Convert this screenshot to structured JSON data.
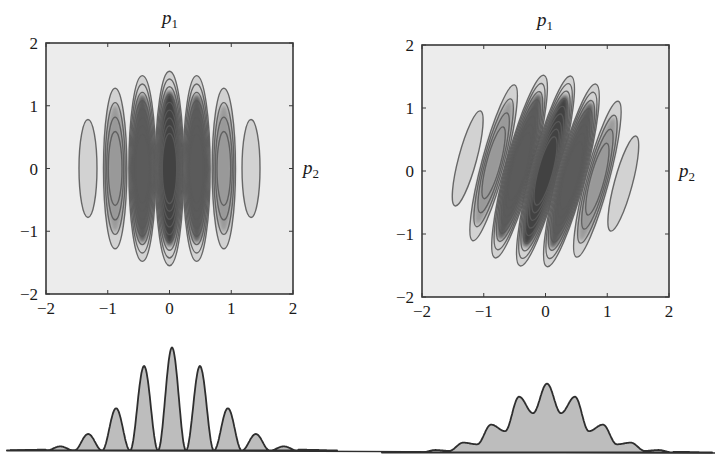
{
  "figure": {
    "colors": {
      "plot_bg": "#ececec",
      "frame": "#3a3a3a",
      "contour_line": "#5a5a5a",
      "contour_fill_light": "#d2d2d2",
      "density_dark": "#2a2a2a",
      "marginal_fill": "#bdbdbd",
      "marginal_line": "#2e2e2e",
      "text": "#1a1a1a"
    }
  },
  "chart_data": [
    {
      "type": "heatmap",
      "subtype": "contour",
      "panel": "top-left",
      "title": "",
      "top_label": "p",
      "top_label_sub": "1",
      "right_label": "p",
      "right_label_sub": "2",
      "xlim": [
        -2,
        2
      ],
      "ylim": [
        -2,
        2
      ],
      "x_ticks": [
        "-2",
        "-1",
        "0",
        "1",
        "2"
      ],
      "y_ticks": [
        "2",
        "1",
        "0",
        "-1",
        "-2"
      ],
      "grid": false,
      "tilt_deg": 0,
      "lobes": [
        {
          "x": -1.32,
          "y": 0.0,
          "half_height": 0.78,
          "levels": 1,
          "darkness": 0.05
        },
        {
          "x": -0.88,
          "y": 0.0,
          "half_height": 1.28,
          "levels": 4,
          "darkness": 0.35
        },
        {
          "x": -0.44,
          "y": 0.0,
          "half_height": 1.48,
          "levels": 8,
          "darkness": 0.75
        },
        {
          "x": 0.0,
          "y": 0.0,
          "half_height": 1.55,
          "levels": 9,
          "darkness": 0.9
        },
        {
          "x": 0.44,
          "y": 0.0,
          "half_height": 1.48,
          "levels": 8,
          "darkness": 0.75
        },
        {
          "x": 0.88,
          "y": 0.0,
          "half_height": 1.28,
          "levels": 4,
          "darkness": 0.35
        },
        {
          "x": 1.32,
          "y": 0.0,
          "half_height": 0.78,
          "levels": 1,
          "darkness": 0.05
        }
      ]
    },
    {
      "type": "heatmap",
      "subtype": "contour",
      "panel": "top-right",
      "title": "",
      "top_label": "p",
      "top_label_sub": "1",
      "right_label": "p",
      "right_label_sub": "2",
      "xlim": [
        -2,
        2
      ],
      "ylim": [
        -2,
        2
      ],
      "x_ticks": [
        "-2",
        "-1",
        "0",
        "1",
        "2"
      ],
      "y_ticks": [
        "2",
        "1",
        "0",
        "-1",
        "-2"
      ],
      "grid": false,
      "tilt_deg": 15,
      "lobes": [
        {
          "x": -1.26,
          "y": 0.2,
          "half_height": 0.78,
          "levels": 1,
          "darkness": 0.05
        },
        {
          "x": -0.84,
          "y": 0.13,
          "half_height": 1.28,
          "levels": 4,
          "darkness": 0.35
        },
        {
          "x": -0.42,
          "y": 0.07,
          "half_height": 1.5,
          "levels": 8,
          "darkness": 0.75
        },
        {
          "x": 0.0,
          "y": 0.0,
          "half_height": 1.56,
          "levels": 9,
          "darkness": 0.9
        },
        {
          "x": 0.42,
          "y": -0.07,
          "half_height": 1.5,
          "levels": 8,
          "darkness": 0.75
        },
        {
          "x": 0.84,
          "y": -0.13,
          "half_height": 1.28,
          "levels": 4,
          "darkness": 0.35
        },
        {
          "x": 1.26,
          "y": -0.2,
          "half_height": 0.78,
          "levels": 1,
          "darkness": 0.05
        }
      ]
    },
    {
      "type": "area",
      "panel": "bottom-left",
      "title": "",
      "description": "marginal fringe distribution, high visibility",
      "xlim": [
        -2,
        2
      ],
      "ylim": [
        0,
        1
      ],
      "axes_visible": false,
      "peak_x": [
        -1.76,
        -1.32,
        -0.88,
        -0.44,
        0.0,
        0.44,
        0.88,
        1.32,
        1.76
      ],
      "peak_heights": [
        0.04,
        0.16,
        0.41,
        0.82,
        1.0,
        0.82,
        0.41,
        0.16,
        0.04
      ],
      "trough_heights": [
        0.0,
        0.0,
        0.0,
        0.0,
        0.0,
        0.0,
        0.0,
        0.0
      ]
    },
    {
      "type": "area",
      "panel": "bottom-right",
      "title": "",
      "description": "marginal fringe distribution, reduced visibility",
      "xlim": [
        -2,
        2
      ],
      "ylim": [
        0,
        1
      ],
      "axes_visible": false,
      "peak_x": [
        -1.76,
        -1.32,
        -0.88,
        -0.44,
        0.0,
        0.44,
        0.88,
        1.32,
        1.76
      ],
      "peak_heights": [
        0.03,
        0.12,
        0.34,
        0.68,
        0.84,
        0.68,
        0.34,
        0.12,
        0.03
      ],
      "trough_heights": [
        0.02,
        0.1,
        0.26,
        0.48,
        0.48,
        0.26,
        0.1,
        0.02
      ]
    }
  ]
}
